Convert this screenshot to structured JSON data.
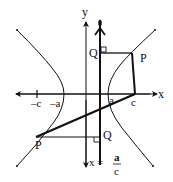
{
  "diagram": {
    "title": "",
    "labels": {
      "y_axis": "y",
      "x_axis": "x",
      "neg_c": "–c",
      "neg_a": "–a",
      "a": "a",
      "c": "c",
      "P_upper": "P",
      "Q_upper": "Q",
      "P_lower": "P",
      "Q_lower": "Q",
      "directrix_lhs": "x =",
      "directrix_num": "a",
      "directrix_den": "c"
    },
    "colors": {
      "stroke": "#111111",
      "background": "#ffffff"
    }
  }
}
